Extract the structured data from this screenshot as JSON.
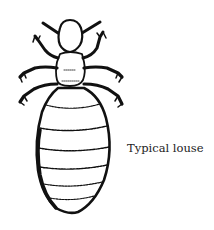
{
  "figure": {
    "caption": "Typical louse"
  }
}
